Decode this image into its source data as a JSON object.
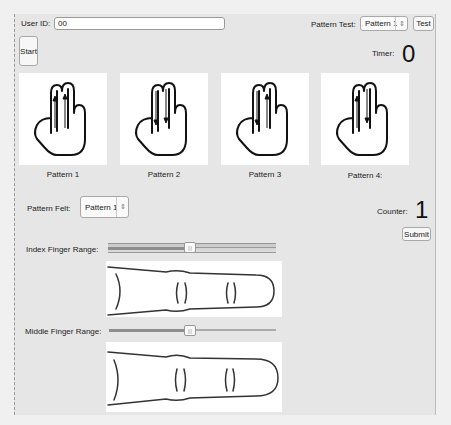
{
  "header": {
    "user_id_label": "User ID:",
    "user_id_value": "00",
    "pattern_test_label": "Pattern Test:",
    "pattern_test_selected": "Pattern 1",
    "test_button": "Test",
    "start_button": "Start",
    "timer_label": "Timer:",
    "timer_value": "0"
  },
  "patterns": [
    {
      "label": "Pattern 1",
      "arrows": [
        "up",
        "up"
      ]
    },
    {
      "label": "Pattern 2",
      "arrows": [
        "down",
        "down"
      ]
    },
    {
      "label": "Pattern 3",
      "arrows": [
        "down",
        "up"
      ]
    },
    {
      "label": "Pattern 4:",
      "arrows": [
        "up",
        "down"
      ]
    }
  ],
  "feedback": {
    "pattern_felt_label": "Pattern Felt:",
    "pattern_felt_selected": "Pattern 1",
    "counter_label": "Counter:",
    "counter_value": "1",
    "submit_button": "Submit"
  },
  "ranges": {
    "index_label": "Index Finger Range:",
    "index_value_pct": 50,
    "middle_label": "Middle Finger Range:",
    "middle_value_pct": 50
  },
  "icons": {
    "select_arrows": "⇳"
  }
}
